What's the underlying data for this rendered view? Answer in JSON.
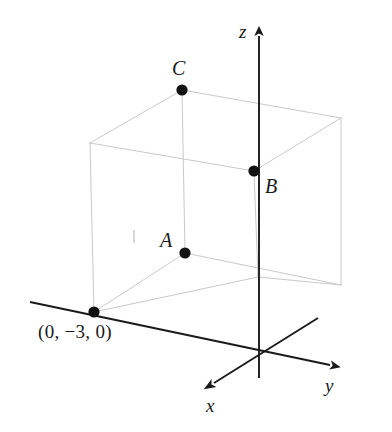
{
  "figure": {
    "type": "3d-coordinate-diagram",
    "background_color": "#ffffff",
    "axis_color": "#1a1a1a",
    "cube_edge_color": "#c9c9c9",
    "point_color": "#111111"
  },
  "axes": {
    "x": {
      "label": "x",
      "label_x": 206,
      "label_y": 396,
      "tip_x": 206,
      "tip_y": 388
    },
    "y": {
      "label": "y",
      "label_x": 325,
      "label_y": 376,
      "tip_x": 338,
      "tip_y": 368
    },
    "z": {
      "label": "z",
      "label_x": 239,
      "label_y": 22,
      "tip_x": 259,
      "tip_y": 28
    },
    "origin": {
      "x": 259,
      "y": 352
    }
  },
  "points": [
    {
      "id": "C",
      "label": "C",
      "px": 182,
      "py": 90,
      "label_x": 172,
      "label_y": 58,
      "radius": 5.6
    },
    {
      "id": "B",
      "label": "B",
      "px": 254,
      "py": 171,
      "label_x": 265,
      "label_y": 176,
      "radius": 5.6
    },
    {
      "id": "A",
      "label": "A",
      "px": 185,
      "py": 253,
      "label_x": 160,
      "label_y": 230,
      "radius": 5.6
    },
    {
      "id": "origin-side",
      "label": "(0, −3, 0)",
      "px": 94,
      "py": 312,
      "label_x": 38,
      "label_y": 322,
      "radius": 5.6
    }
  ],
  "cube": {
    "vertices": {
      "front_left_top": [
        90,
        143
      ],
      "front_mid_top": [
        182,
        90
      ],
      "back_right_top": [
        341,
        118
      ],
      "right_mid_top": [
        254,
        171
      ],
      "front_left_bottom": [
        94,
        312
      ],
      "front_mid_bottom": [
        185,
        253
      ],
      "back_right_bottom": [
        341,
        285
      ],
      "right_mid_bottom": [
        258,
        277
      ]
    }
  },
  "artifact": {
    "name": "scan-speck",
    "x": 133,
    "y": 230,
    "width": 2,
    "height": 13
  }
}
